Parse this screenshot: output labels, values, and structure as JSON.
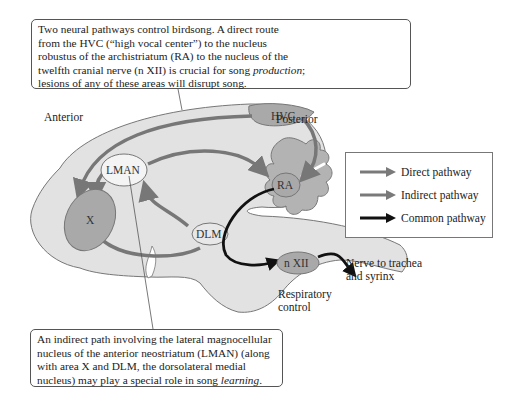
{
  "callouts": {
    "top": {
      "line1": "Two neural pathways control birdsong. A direct route",
      "line2": "from the HVC (“high vocal center”) to the nucleus",
      "line3": "robustus of the archistriatum (RA) to the nucleus of the",
      "line4_pre": "twelfth cranial nerve (n XII) is crucial for song ",
      "line4_em": "production",
      "line4_post": ";",
      "line5": "lesions of any of these areas will disrupt song."
    },
    "bottom": {
      "line1": "An indirect path involving the lateral magnocellular",
      "line2": "nucleus of the anterior neostriatum (LMAN) (along",
      "line3": "with area X and DLM, the dorsolateral medial",
      "line4_pre": "nucleus) may play a special role in song ",
      "line4_em": "learning",
      "line4_post": "."
    }
  },
  "labels": {
    "anterior": "Anterior",
    "posterior": "Posterior",
    "nerve_line1": "Nerve to trachea",
    "nerve_line2": "and syrinx",
    "resp_line1": "Respiratory",
    "resp_line2": "control"
  },
  "nodes": {
    "hvc": "HVC",
    "lman": "LMAN",
    "ra": "RA",
    "x": "X",
    "dlm": "DLM",
    "nxii": "n XII"
  },
  "legend": {
    "items": [
      {
        "label": "Direct pathway",
        "color": "#7a7a7a"
      },
      {
        "label": "Indirect pathway",
        "color": "#7a7a7a"
      },
      {
        "label": "Common pathway",
        "color": "#111111"
      }
    ]
  },
  "colors": {
    "brain_fill": "#e2e2e2",
    "brain_stroke": "#777777",
    "nucleus_dark": "#a9a9a9",
    "nucleus_light": "#f4f4f4",
    "cerebellum_fill": "#b3b3b3",
    "direct_arrow": "#777777",
    "common_arrow": "#111111"
  }
}
